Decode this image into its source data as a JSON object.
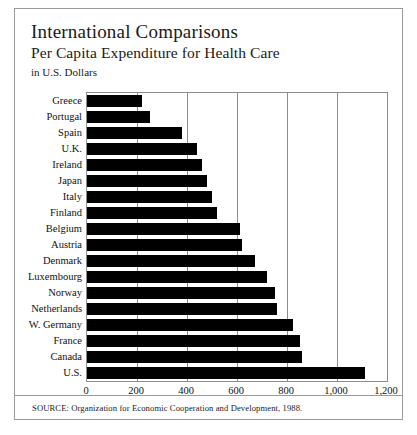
{
  "header": {
    "title": "International Comparisons",
    "subtitle": "Per Capita Expenditure for Health Care",
    "units": "in U.S. Dollars"
  },
  "source": "SOURCE: Organization for Economic Cooperation and Development, 1988.",
  "chart_data": {
    "type": "bar",
    "orientation": "horizontal",
    "title": "International Comparisons",
    "subtitle": "Per Capita Expenditure for Health Care",
    "xlabel": "in U.S. Dollars",
    "ylabel": "",
    "xlim": [
      0,
      1200
    ],
    "xticks": [
      0,
      200,
      400,
      600,
      800,
      1000,
      1200
    ],
    "xticklabels": [
      "0",
      "200",
      "400",
      "600",
      "800",
      "1,000",
      "1,200"
    ],
    "grid": true,
    "legend": false,
    "bar_color": "#000000",
    "categories": [
      "Greece",
      "Portugal",
      "Spain",
      "U.K.",
      "Ireland",
      "Japan",
      "Italy",
      "Finland",
      "Belgium",
      "Austria",
      "Denmark",
      "Luxembourg",
      "Norway",
      "Netherlands",
      "W. Germany",
      "France",
      "Canada",
      "U.S."
    ],
    "values": [
      220,
      250,
      380,
      440,
      460,
      480,
      500,
      520,
      610,
      620,
      670,
      720,
      750,
      760,
      825,
      850,
      860,
      1110
    ]
  }
}
